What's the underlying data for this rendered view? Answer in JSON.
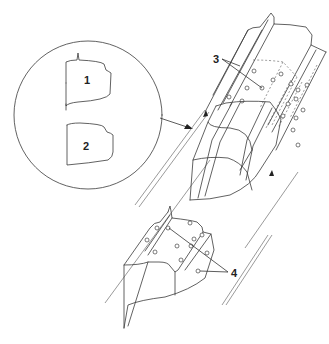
{
  "diagram": {
    "type": "exploded-view technical illustration",
    "detail_inset": {
      "shape": "circle",
      "items": [
        {
          "callout": "1",
          "description": "profile shape 1"
        },
        {
          "callout": "2",
          "description": "profile shape 2"
        }
      ]
    },
    "callouts": [
      {
        "id": "1",
        "label": "1"
      },
      {
        "id": "2",
        "label": "2"
      },
      {
        "id": "3",
        "label": "3"
      },
      {
        "id": "4",
        "label": "4"
      }
    ],
    "assemblies": [
      {
        "name": "upper-channel-assembly",
        "callout": "3"
      },
      {
        "name": "middle-fairing-section"
      },
      {
        "name": "lower-bracket-assembly",
        "callout": "4"
      }
    ]
  }
}
